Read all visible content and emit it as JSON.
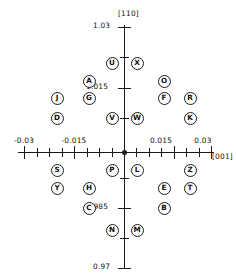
{
  "figure": {
    "type": "scatter",
    "width": 236,
    "height": 278,
    "background": "#ffffff",
    "marker_style": "circled-letter",
    "line_color": "#1a1a1a"
  },
  "axes": {
    "y": {
      "title": "[110]",
      "title_x": 118,
      "title_y": 10,
      "min": 0.97,
      "max": 1.03,
      "pixel_top": 25,
      "pixel_bottom": 268,
      "axis_x": 124,
      "labels": [
        {
          "text": "1.03",
          "value": 1.03,
          "x": 93,
          "y": 26,
          "major": true
        },
        {
          "text": "1.015",
          "value": 1.015,
          "x": 86,
          "y": 87,
          "major": true
        },
        {
          "text": "0.985",
          "value": 0.985,
          "x": 86,
          "y": 207,
          "major": true
        },
        {
          "text": "0.97",
          "value": 0.97,
          "x": 93,
          "y": 267,
          "major": true
        }
      ],
      "ticks_major_y": [
        27,
        88,
        152,
        208,
        268
      ],
      "ticks_minor_y": [
        57,
        118,
        178,
        238
      ]
    },
    "x": {
      "title": "[001]",
      "title_x": 212,
      "title_y": 152,
      "min": -0.03,
      "max": 0.03,
      "pixel_left": 24,
      "pixel_right": 211,
      "axis_y": 152,
      "labels": [
        {
          "text": "-0.03",
          "value": -0.03,
          "x": 24,
          "y": 137,
          "major": true
        },
        {
          "text": "-0.015",
          "value": -0.015,
          "x": 74,
          "y": 137,
          "major": true
        },
        {
          "text": "0.015",
          "value": 0.015,
          "x": 161,
          "y": 137,
          "major": true
        },
        {
          "text": "0.03",
          "value": 0.03,
          "x": 203,
          "y": 137,
          "major": true
        }
      ],
      "ticks_major_x": [
        24,
        74,
        124,
        174,
        211
      ],
      "ticks_minor_x": [
        37,
        49,
        62,
        87,
        99,
        112,
        136,
        149,
        161,
        186,
        199
      ]
    }
  },
  "chart_data": {
    "type": "scatter",
    "title": "",
    "xlabel": "[001]",
    "ylabel": "[110]",
    "xlim": [
      -0.03,
      0.03
    ],
    "ylim": [
      0.97,
      1.03
    ],
    "grid": false,
    "legend": "none",
    "marker_labels": true,
    "points": [
      {
        "label": "U",
        "x": -0.002,
        "y": 1.0205,
        "px": 112,
        "py": 63
      },
      {
        "label": "X",
        "x": 0.0055,
        "y": 1.0205,
        "px": 137,
        "py": 63
      },
      {
        "label": "A",
        "x": -0.009,
        "y": 1.0162,
        "px": 89,
        "py": 81
      },
      {
        "label": "O",
        "x": 0.0165,
        "y": 1.0162,
        "px": 164,
        "py": 81
      },
      {
        "label": "J",
        "x": -0.0185,
        "y": 1.0128,
        "px": 57,
        "py": 98
      },
      {
        "label": "G",
        "x": -0.009,
        "y": 1.0128,
        "px": 89,
        "py": 98
      },
      {
        "label": "F",
        "x": 0.0165,
        "y": 1.0128,
        "px": 164,
        "py": 98
      },
      {
        "label": "R",
        "x": 0.0245,
        "y": 1.0128,
        "px": 190,
        "py": 98
      },
      {
        "label": "D",
        "x": -0.0185,
        "y": 1.0095,
        "px": 57,
        "py": 118
      },
      {
        "label": "V",
        "x": -0.002,
        "y": 1.0095,
        "px": 112,
        "py": 118
      },
      {
        "label": "W",
        "x": 0.0055,
        "y": 1.0095,
        "px": 137,
        "py": 118
      },
      {
        "label": "K",
        "x": 0.0245,
        "y": 1.0095,
        "px": 190,
        "py": 118
      },
      {
        "label": "S",
        "x": -0.0185,
        "y": 0.9952,
        "px": 57,
        "py": 170
      },
      {
        "label": "P",
        "x": -0.002,
        "y": 0.9952,
        "px": 112,
        "py": 170
      },
      {
        "label": "L",
        "x": 0.0055,
        "y": 0.9952,
        "px": 137,
        "py": 170
      },
      {
        "label": "Z",
        "x": 0.0245,
        "y": 0.9952,
        "px": 190,
        "py": 170
      },
      {
        "label": "Y",
        "x": -0.0185,
        "y": 0.9915,
        "px": 57,
        "py": 188
      },
      {
        "label": "H",
        "x": -0.009,
        "y": 0.9915,
        "px": 89,
        "py": 188
      },
      {
        "label": "E",
        "x": 0.0165,
        "y": 0.9915,
        "px": 164,
        "py": 188
      },
      {
        "label": "T",
        "x": 0.0245,
        "y": 0.9915,
        "px": 190,
        "py": 188
      },
      {
        "label": "C",
        "x": -0.009,
        "y": 0.9865,
        "px": 89,
        "py": 208
      },
      {
        "label": "B",
        "x": 0.0165,
        "y": 0.9865,
        "px": 164,
        "py": 208
      },
      {
        "label": "N",
        "x": -0.002,
        "y": 0.982,
        "px": 112,
        "py": 230
      },
      {
        "label": "M",
        "x": 0.0055,
        "y": 0.982,
        "px": 137,
        "py": 230
      }
    ]
  }
}
